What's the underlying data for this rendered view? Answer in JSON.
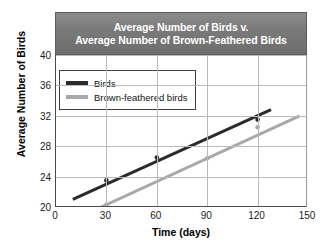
{
  "chart_data": {
    "type": "line",
    "title": "Average Number of Birds v. Average Number of Brown-Feathered Birds",
    "title_line1": "Average Number of Birds v.",
    "title_line2": "Average Number of Brown-Feathered Birds",
    "xlabel": "Time (days)",
    "ylabel": "Average Number of Birds",
    "xlim": [
      0,
      150
    ],
    "ylim": [
      20,
      40
    ],
    "xticks": [
      0,
      30,
      60,
      90,
      120,
      150
    ],
    "yticks": [
      20,
      24,
      28,
      32,
      36,
      40
    ],
    "xtick_labels": [
      "0",
      "30",
      "60",
      "90",
      "120",
      "150"
    ],
    "ytick_labels": [
      "20",
      "24",
      "28",
      "32",
      "36",
      "40"
    ],
    "grid": true,
    "legend_position": "upper-left",
    "series": [
      {
        "name": "Birds",
        "color": "#2b2b2b",
        "line": {
          "x_start": 10,
          "y_start": 21.0,
          "x_end": 128,
          "y_end": 32.8
        },
        "points": [
          {
            "x": 30,
            "y": 23.5
          },
          {
            "x": 60,
            "y": 26.5
          },
          {
            "x": 120,
            "y": 31.5
          }
        ]
      },
      {
        "name": "Brown-feathered birds",
        "color": "#a8a8a8",
        "line": {
          "x_start": 27,
          "y_start": 20.0,
          "x_end": 145,
          "y_end": 32.0
        },
        "points": [
          {
            "x": 30,
            "y": 20.3
          },
          {
            "x": 90,
            "y": 26.4
          },
          {
            "x": 120,
            "y": 30.5
          }
        ]
      }
    ]
  },
  "legend": {
    "items": [
      {
        "label": "Birds",
        "color": "#2b2b2b"
      },
      {
        "label": "Brown-feathered birds",
        "color": "#a8a8a8"
      }
    ]
  }
}
